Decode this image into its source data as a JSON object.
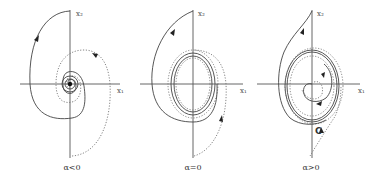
{
  "figure": {
    "panels": [
      {
        "id": "stable-focus",
        "caption": "α<0",
        "x_axis_label": "x₁",
        "y_axis_label": "x₂",
        "description": "Trajectories spiral inward to a stable equilibrium at origin"
      },
      {
        "id": "center",
        "caption": "α=0",
        "x_axis_label": "x₁",
        "y_axis_label": "x₂",
        "description": "Trajectories approach a closed orbit around the origin"
      },
      {
        "id": "limit-cycle",
        "caption": "α>0",
        "x_axis_label": "x₁",
        "y_axis_label": "x₂",
        "cycle_label": "C",
        "description": "Stable limit cycle C; inner trajectories spiral outward, outer spiral inward"
      }
    ],
    "line_styles": {
      "solid_color": "#444444",
      "dotted_color": "#777777",
      "axis_color": "#555555"
    }
  }
}
